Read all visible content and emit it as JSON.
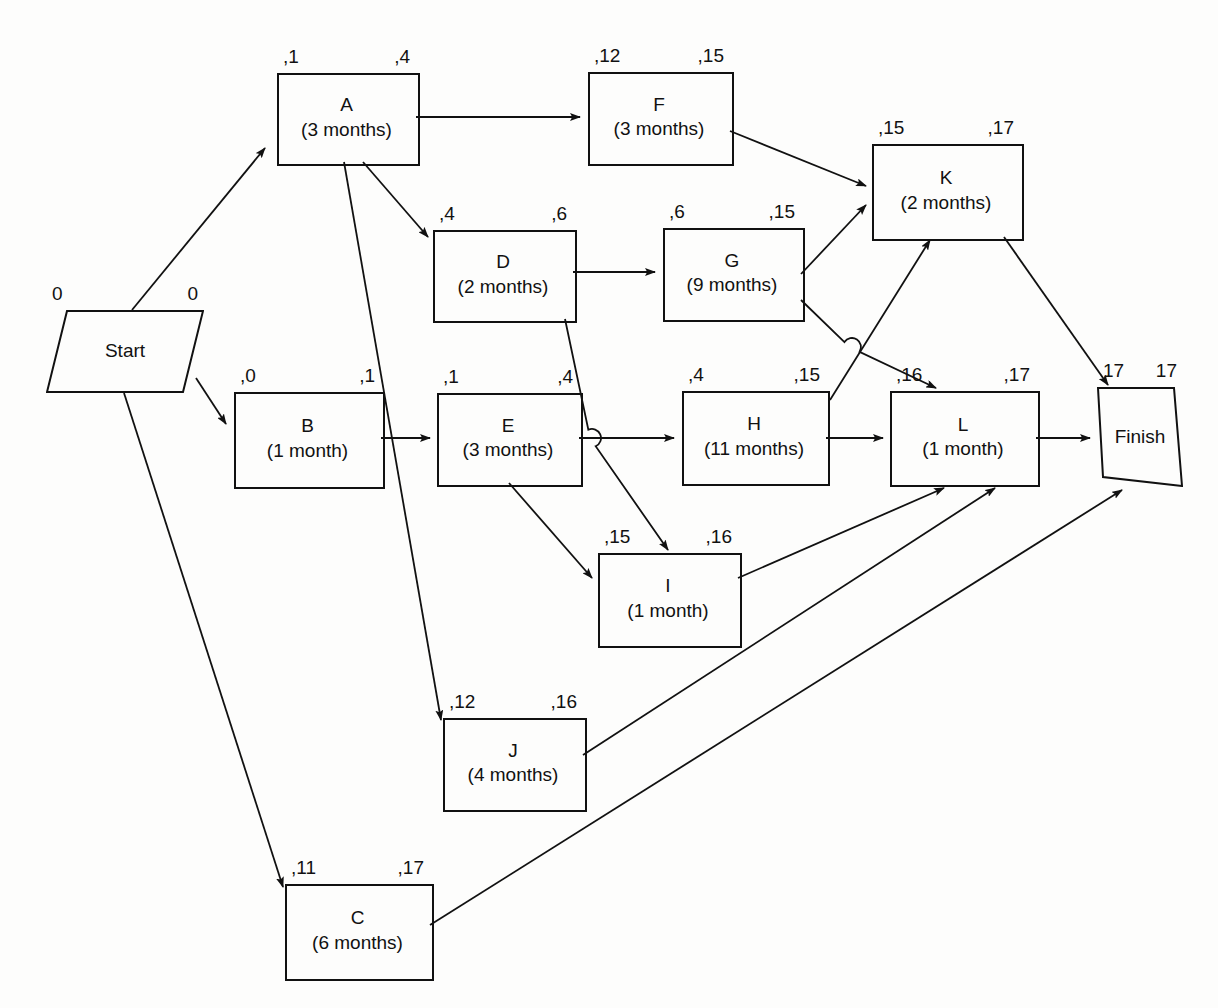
{
  "diagram": {
    "type": "activity-on-node-network",
    "stroke_color": "#111111",
    "background_color": "#fdfdfc"
  },
  "nodes": [
    {
      "id": "start",
      "shape": "parallelogram",
      "name": "Start",
      "duration": "",
      "slack_left": "0",
      "slack_right": "0",
      "x": 46,
      "y": 310,
      "w": 158,
      "h": 83
    },
    {
      "id": "A",
      "shape": "rect",
      "name": "A",
      "duration": "(3 months)",
      "slack_left": ",1",
      "slack_right": ",4",
      "x": 277,
      "y": 73,
      "w": 139,
      "h": 89
    },
    {
      "id": "B",
      "shape": "rect",
      "name": "B",
      "duration": "(1 month)",
      "slack_left": ",0",
      "slack_right": ",1",
      "x": 234,
      "y": 392,
      "w": 147,
      "h": 93
    },
    {
      "id": "C",
      "shape": "rect",
      "name": "C",
      "duration": "(6 months)",
      "slack_left": ",11",
      "slack_right": ",17",
      "x": 285,
      "y": 884,
      "w": 145,
      "h": 93
    },
    {
      "id": "D",
      "shape": "rect",
      "name": "D",
      "duration": "(2 months)",
      "slack_left": ",4",
      "slack_right": ",6",
      "x": 433,
      "y": 230,
      "w": 140,
      "h": 89
    },
    {
      "id": "E",
      "shape": "rect",
      "name": "E",
      "duration": "(3 months)",
      "slack_left": ",1",
      "slack_right": ",4",
      "x": 437,
      "y": 393,
      "w": 142,
      "h": 90
    },
    {
      "id": "F",
      "shape": "rect",
      "name": "F",
      "duration": "(3 months)",
      "slack_left": ",12",
      "slack_right": ",15",
      "x": 588,
      "y": 72,
      "w": 142,
      "h": 90
    },
    {
      "id": "G",
      "shape": "rect",
      "name": "G",
      "duration": "(9 months)",
      "slack_left": ",6",
      "slack_right": ",15",
      "x": 663,
      "y": 228,
      "w": 138,
      "h": 90
    },
    {
      "id": "H",
      "shape": "rect",
      "name": "H",
      "duration": "(11 months)",
      "slack_left": ",4",
      "slack_right": ",15",
      "x": 682,
      "y": 391,
      "w": 144,
      "h": 91
    },
    {
      "id": "I",
      "shape": "rect",
      "name": "I",
      "duration": "(1 month)",
      "slack_left": ",15",
      "slack_right": ",16",
      "x": 598,
      "y": 553,
      "w": 140,
      "h": 91
    },
    {
      "id": "J",
      "shape": "rect",
      "name": "J",
      "duration": "(4 months)",
      "slack_left": ",12",
      "slack_right": ",16",
      "x": 443,
      "y": 718,
      "w": 140,
      "h": 90
    },
    {
      "id": "K",
      "shape": "rect",
      "name": "K",
      "duration": "(2 months)",
      "slack_left": ",15",
      "slack_right": ",17",
      "x": 872,
      "y": 144,
      "w": 148,
      "h": 93
    },
    {
      "id": "L",
      "shape": "rect",
      "name": "L",
      "duration": "(1 month)",
      "slack_left": ",16",
      "slack_right": ",17",
      "x": 890,
      "y": 391,
      "w": 146,
      "h": 92
    },
    {
      "id": "finish",
      "shape": "parallelogram",
      "name": "Finish",
      "duration": "",
      "slack_left": "17",
      "slack_right": "17",
      "x": 1097,
      "y": 387,
      "w": 86,
      "h": 100
    }
  ],
  "edges": [
    {
      "from": "start",
      "to": "A",
      "path": "M 132,310 L 265,148",
      "hop": null
    },
    {
      "from": "start",
      "to": "B",
      "path": "M 196,378 L 226,424",
      "hop": null
    },
    {
      "from": "start",
      "to": "C",
      "path": "M 124,393 L 283,887",
      "hop": null
    },
    {
      "from": "A",
      "to": "F",
      "path": "M 416,117 L 580,117",
      "hop": null
    },
    {
      "from": "A",
      "to": "D",
      "path": "M 363,162 L 428,237",
      "hop": null
    },
    {
      "from": "A",
      "to": "J",
      "path": "M 344,162 L 441,720",
      "hop": null
    },
    {
      "from": "B",
      "to": "E",
      "path": "M 381,438 L 430,438",
      "hop": null
    },
    {
      "from": "D",
      "to": "G",
      "path": "M 573,272 L 655,272",
      "hop": null
    },
    {
      "from": "D",
      "to": "I",
      "path": "M 565,319 L 668,550",
      "hop": {
        "x": 592,
        "y": 438
      }
    },
    {
      "from": "E",
      "to": "H",
      "path": "M 579,438 L 674,438",
      "hop": null
    },
    {
      "from": "E",
      "to": "I",
      "path": "M 509,483 L 592,578",
      "hop": null
    },
    {
      "from": "F",
      "to": "K",
      "path": "M 730,131 L 866,186",
      "hop": null
    },
    {
      "from": "G",
      "to": "K",
      "path": "M 801,274 L 866,205",
      "hop": null
    },
    {
      "from": "G",
      "to": "L",
      "path": "M 801,300 L 936,388",
      "hop": {
        "x": 852,
        "y": 347
      }
    },
    {
      "from": "H",
      "to": "K",
      "path": "M 830,400 L 930,240",
      "hop": null
    },
    {
      "from": "H",
      "to": "L",
      "path": "M 826,438 L 883,438",
      "hop": null
    },
    {
      "from": "I",
      "to": "L",
      "path": "M 738,578 L 944,488",
      "hop": null
    },
    {
      "from": "J",
      "to": "L",
      "path": "M 583,755 L 995,488",
      "hop": null
    },
    {
      "from": "K",
      "to": "finish",
      "path": "M 1004,237 L 1108,385",
      "hop": null
    },
    {
      "from": "L",
      "to": "finish",
      "path": "M 1036,438 L 1090,438",
      "hop": null
    },
    {
      "from": "C",
      "to": "finish",
      "path": "M 430,925 L 1122,490",
      "hop": null
    }
  ]
}
